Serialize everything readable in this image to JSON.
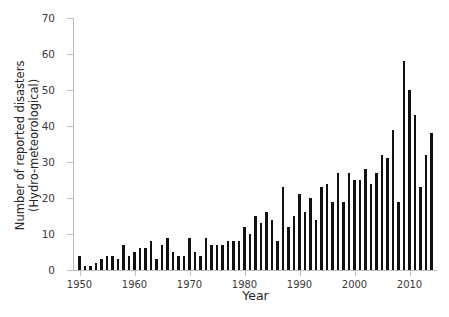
{
  "chart_data": {
    "type": "bar",
    "title": "",
    "xlabel": "Year",
    "ylabel_line1": "Number of reported disasters",
    "ylabel_line2": "(Hydro-meteorological)",
    "ylim": [
      0,
      70
    ],
    "ytick_labels": [
      "0",
      "10",
      "20",
      "30",
      "40",
      "50",
      "60",
      "70"
    ],
    "ytick_values": [
      0,
      10,
      20,
      30,
      40,
      50,
      60,
      70
    ],
    "xtick_labels": [
      "1950",
      "1960",
      "1970",
      "1980",
      "1990",
      "2000",
      "2010"
    ],
    "xtick_values": [
      1950,
      1960,
      1970,
      1980,
      1990,
      2000,
      2010
    ],
    "xlim": [
      1949,
      2015
    ],
    "grid": false,
    "legend": false,
    "bar_color": "#111111",
    "axis_color": "#bdbdbd",
    "categories": [
      1950,
      1951,
      1952,
      1953,
      1954,
      1955,
      1956,
      1957,
      1958,
      1959,
      1960,
      1961,
      1962,
      1963,
      1964,
      1965,
      1966,
      1967,
      1968,
      1969,
      1970,
      1971,
      1972,
      1973,
      1974,
      1975,
      1976,
      1977,
      1978,
      1979,
      1980,
      1981,
      1982,
      1983,
      1984,
      1985,
      1986,
      1987,
      1988,
      1989,
      1990,
      1991,
      1992,
      1993,
      1994,
      1995,
      1996,
      1997,
      1998,
      1999,
      2000,
      2001,
      2002,
      2003,
      2004,
      2005,
      2006,
      2007,
      2008,
      2009,
      2010,
      2011,
      2012,
      2013,
      2014
    ],
    "values": [
      4,
      1,
      1,
      2,
      3,
      4,
      4,
      3,
      7,
      4,
      5,
      6,
      6,
      8,
      3,
      7,
      9,
      5,
      4,
      4,
      9,
      5,
      4,
      9,
      7,
      7,
      7,
      8,
      8,
      8,
      12,
      10,
      15,
      13,
      16,
      14,
      8,
      23,
      12,
      15,
      21,
      16,
      20,
      14,
      23,
      24,
      19,
      27,
      19,
      27,
      25,
      25,
      28,
      24,
      27,
      32,
      31,
      39,
      19,
      58,
      50,
      43,
      23,
      32,
      38
    ],
    "peak": {
      "year": 2009,
      "value": 58
    },
    "n_bars": 65
  }
}
